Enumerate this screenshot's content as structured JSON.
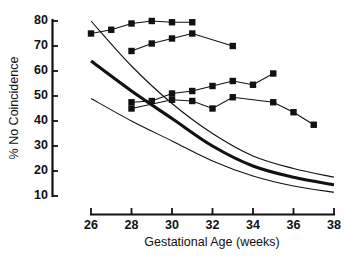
{
  "chart_data": {
    "type": "line",
    "title": "",
    "xlabel": "Gestational Age (weeks)",
    "ylabel": "% No Coincidence",
    "xlim": [
      26,
      38
    ],
    "ylim": [
      10,
      80
    ],
    "grid": false,
    "legend": "none",
    "xticks": [
      26,
      28,
      30,
      32,
      34,
      36,
      38
    ],
    "yticks": [
      10,
      20,
      30,
      40,
      50,
      60,
      70,
      80
    ],
    "series": [
      {
        "name": "marker-series-1",
        "marker": "square",
        "style": "line-with-square-markers",
        "x": [
          26,
          27,
          28,
          29,
          30,
          31
        ],
        "values": [
          75,
          76.5,
          79,
          80,
          79.5,
          79.5
        ]
      },
      {
        "name": "marker-series-2",
        "marker": "square",
        "style": "line-with-square-markers",
        "x": [
          28,
          29,
          30,
          31,
          33
        ],
        "values": [
          68,
          71,
          73,
          75,
          70
        ]
      },
      {
        "name": "marker-series-3",
        "marker": "square",
        "style": "line-with-square-markers",
        "x": [
          28,
          29,
          30,
          31,
          32,
          33,
          34,
          35
        ],
        "values": [
          47.5,
          48,
          51,
          52,
          54,
          56,
          54.5,
          59
        ]
      },
      {
        "name": "marker-series-4",
        "marker": "square",
        "style": "line-with-square-markers",
        "x": [
          28,
          30,
          31,
          32,
          33,
          35,
          36,
          37
        ],
        "values": [
          45,
          48.5,
          48,
          45,
          49.5,
          47.5,
          43.5,
          38.5
        ]
      },
      {
        "name": "upper-confidence-curve",
        "marker": "none",
        "style": "thin-smooth-curve",
        "x": [
          26,
          28,
          30,
          32,
          34,
          36,
          38
        ],
        "values": [
          80,
          62,
          47,
          35,
          26,
          21,
          17.5
        ]
      },
      {
        "name": "fitted-curve",
        "marker": "none",
        "style": "thick-smooth-curve",
        "x": [
          26,
          28,
          30,
          32,
          34,
          36,
          38
        ],
        "values": [
          64,
          52,
          41,
          30,
          22,
          17.5,
          14.5
        ]
      },
      {
        "name": "lower-confidence-curve",
        "marker": "none",
        "style": "thin-smooth-curve",
        "x": [
          26,
          28,
          30,
          32,
          34,
          36,
          38
        ],
        "values": [
          49,
          40,
          32,
          24,
          18,
          14,
          11.5
        ]
      }
    ]
  },
  "axes": {
    "y_label": "% No Coincidence",
    "x_label": "Gestational Age (weeks)",
    "y_ticks": [
      "80",
      "70",
      "60",
      "50",
      "40",
      "30",
      "20",
      "10"
    ],
    "x_ticks": [
      "26",
      "28",
      "30",
      "32",
      "34",
      "36",
      "38"
    ]
  },
  "colors": {
    "ink": "#111111",
    "background": "#ffffff"
  }
}
